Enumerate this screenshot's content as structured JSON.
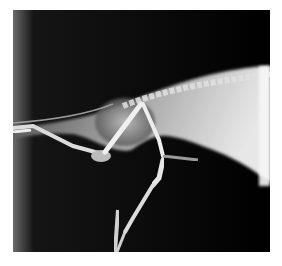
{
  "image": {
    "type": "radiograph",
    "view": "lateral",
    "subject": "small mammal hindquarters and hindlimbs",
    "colors": {
      "background": "#ffffff",
      "film_dark": "#000000",
      "soft_tissue": "#8a8a8a",
      "bone": "#e8e8e8"
    }
  },
  "caption": {
    "text": ""
  }
}
